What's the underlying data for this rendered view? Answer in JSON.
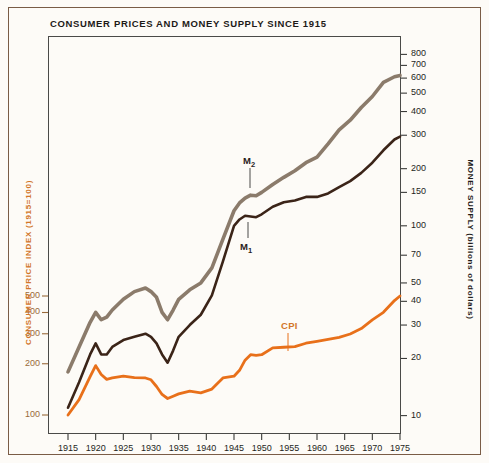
{
  "chart_data": {
    "type": "line",
    "title": "CONSUMER PRICES AND MONEY SUPPLY SINCE 1915",
    "xlabel": "",
    "ylabel": "CONSUMER PRICE INDEX (1915=100)",
    "y2label": "MONEY SUPPLY (billions of dollars)",
    "scale": "log",
    "grid": false,
    "legend_position": "inline-annotations",
    "x_range": [
      1915,
      1975
    ],
    "x_ticks": [
      1915,
      1920,
      1925,
      1930,
      1935,
      1940,
      1945,
      1950,
      1955,
      1960,
      1965,
      1970,
      1975
    ],
    "left_axis": {
      "label": "CONSUMER PRICE INDEX (1915=100)",
      "ticks": [
        100,
        200,
        300,
        400,
        500
      ],
      "tick_labels": [
        "100",
        "200",
        "300",
        "400",
        "500"
      ],
      "color": "#d2762a",
      "range": [
        80,
        700
      ]
    },
    "right_axis": {
      "label": "MONEY SUPPLY (billions of dollars)",
      "ticks": [
        10,
        20,
        30,
        40,
        50,
        70,
        100,
        150,
        200,
        300,
        400,
        500,
        600,
        700,
        800
      ],
      "tick_labels": [
        "10",
        "20",
        "30",
        "40",
        "50",
        "70",
        "100",
        "150",
        "200",
        "300",
        "400",
        "500",
        "600",
        "700",
        "800"
      ],
      "color": "#241f1c",
      "range": [
        8,
        1000
      ]
    },
    "series": [
      {
        "name": "M2",
        "label": "M₂",
        "color": "#8b7b6b",
        "axis": "right",
        "x": [
          1915,
          1917,
          1919,
          1920,
          1921,
          1922,
          1923,
          1925,
          1927,
          1929,
          1930,
          1931,
          1932,
          1933,
          1934,
          1935,
          1937,
          1939,
          1941,
          1943,
          1945,
          1946,
          1947,
          1948,
          1949,
          1950,
          1952,
          1954,
          1956,
          1958,
          1960,
          1962,
          1964,
          1966,
          1968,
          1970,
          1972,
          1974,
          1975
        ],
        "values": [
          17,
          23,
          31,
          35,
          32,
          33,
          36,
          41,
          45,
          47,
          45,
          42,
          35,
          32,
          36,
          41,
          46,
          50,
          60,
          85,
          120,
          132,
          140,
          145,
          144,
          150,
          165,
          180,
          195,
          215,
          230,
          270,
          320,
          360,
          420,
          480,
          570,
          610,
          620
        ]
      },
      {
        "name": "M1",
        "label": "M₁",
        "color": "#3b2418",
        "axis": "right",
        "x": [
          1915,
          1917,
          1919,
          1920,
          1921,
          1922,
          1923,
          1925,
          1927,
          1929,
          1930,
          1931,
          1932,
          1933,
          1934,
          1935,
          1937,
          1939,
          1941,
          1943,
          1945,
          1946,
          1947,
          1948,
          1949,
          1950,
          1952,
          1954,
          1956,
          1958,
          1960,
          1962,
          1964,
          1966,
          1968,
          1970,
          1972,
          1974,
          1975
        ],
        "values": [
          11,
          15,
          21,
          24,
          21,
          21,
          23,
          25,
          26,
          27,
          26,
          24,
          21,
          19,
          22,
          26,
          30,
          34,
          43,
          65,
          100,
          108,
          113,
          112,
          111,
          115,
          126,
          133,
          136,
          142,
          142,
          148,
          160,
          172,
          190,
          215,
          250,
          285,
          295
        ]
      },
      {
        "name": "CPI",
        "label": "CPI",
        "color": "#e8701a",
        "axis": "left",
        "x": [
          1915,
          1917,
          1919,
          1920,
          1921,
          1922,
          1923,
          1925,
          1927,
          1929,
          1930,
          1931,
          1932,
          1933,
          1934,
          1935,
          1937,
          1939,
          1941,
          1943,
          1945,
          1946,
          1947,
          1948,
          1949,
          1950,
          1952,
          1954,
          1956,
          1958,
          1960,
          1962,
          1964,
          1966,
          1968,
          1970,
          1972,
          1974,
          1975
        ],
        "values": [
          100,
          123,
          168,
          195,
          173,
          162,
          165,
          169,
          166,
          165,
          161,
          147,
          132,
          125,
          129,
          133,
          138,
          135,
          142,
          165,
          169,
          183,
          210,
          226,
          224,
          226,
          248,
          250,
          252,
          264,
          271,
          278,
          286,
          299,
          322,
          362,
          401,
          470,
          500
        ]
      }
    ],
    "annotations": [
      {
        "text": "M₂",
        "series": "M2"
      },
      {
        "text": "M₁",
        "series": "M1"
      },
      {
        "text": "CPI",
        "series": "CPI"
      }
    ]
  },
  "colors": {
    "background": "#fdfbf7",
    "outer_border": "#7a5c46",
    "plot_border": "#4a4a48",
    "m2": "#8b7b6b",
    "m1": "#3b2418",
    "cpi": "#e8701a",
    "left_axis_text": "#d2762a",
    "right_axis_text": "#241f1c",
    "title_text": "#1d1a17"
  },
  "labels": {
    "title": "CONSUMER PRICES AND MONEY SUPPLY SINCE 1915",
    "left_axis_title": "CONSUMER PRICE INDEX (1915=100)",
    "right_axis_title": "MONEY SUPPLY (billions of dollars)",
    "m2": "M",
    "m2_sub": "2",
    "m1": "M",
    "m1_sub": "1",
    "cpi": "CPI"
  }
}
